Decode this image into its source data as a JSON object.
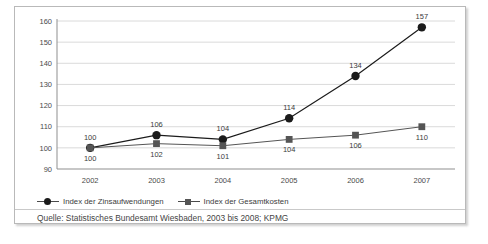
{
  "chart_data": {
    "type": "line",
    "title": "",
    "subtitle": "",
    "xlabel": "",
    "ylabel": "",
    "categories": [
      "2002",
      "2003",
      "2004",
      "2005",
      "2006",
      "2007"
    ],
    "series": [
      {
        "name": "Index der Zinsaufwendungen",
        "marker": "circle",
        "color": "#1b1b1b",
        "label_position": "above",
        "values": [
          100,
          106,
          104,
          114,
          134,
          157
        ]
      },
      {
        "name": "Index der Gesamtkosten",
        "marker": "square",
        "color": "#555555",
        "label_position": "below",
        "values": [
          100,
          102,
          101,
          104,
          106,
          110
        ]
      }
    ],
    "ylim": [
      90,
      160
    ],
    "ytick_step": 10,
    "yticks": [
      "160",
      "150",
      "140",
      "130",
      "120",
      "110",
      "100",
      "90"
    ],
    "grid": true,
    "legend_position": "bottom-left"
  },
  "legend": {
    "entries": [
      {
        "label": "Index der Zinsaufwendungen"
      },
      {
        "label": "Index der Gesamtkosten"
      }
    ]
  },
  "source": {
    "text": "Quelle: Statistisches Bundesamt Wiesbaden, 2003 bis 2008; KPMG"
  },
  "colors": {
    "series1": "#1b1b1b",
    "series2": "#555555",
    "grid": "#d0d0d0",
    "axis": "#8f8f8f",
    "border": "#b9b9b9",
    "text": "#3b3b3b"
  }
}
